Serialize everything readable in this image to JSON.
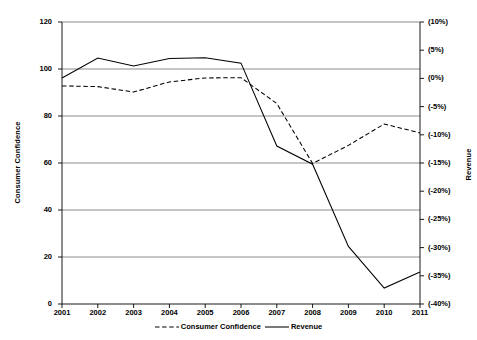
{
  "chart_data": {
    "type": "line",
    "title": "",
    "xlabel": "",
    "grid": true,
    "legend_position": "bottom",
    "categories": [
      "2001",
      "2002",
      "2003",
      "2004",
      "2005",
      "2006",
      "2007",
      "2008",
      "2009",
      "2010",
      "2011"
    ],
    "x": [
      2001,
      2002,
      2003,
      2004,
      2005,
      2006,
      2007,
      2008,
      2009,
      2010,
      2011
    ],
    "axes": {
      "left": {
        "label": "Consumer Confidence",
        "ylim": [
          0,
          120
        ],
        "tick_step": 20,
        "ticks": [
          0,
          20,
          40,
          60,
          80,
          100,
          120
        ],
        "tick_labels": [
          "0",
          "20",
          "40",
          "60",
          "80",
          "100",
          "120"
        ]
      },
      "right": {
        "label": "Revenue",
        "ylim": [
          -40,
          10
        ],
        "tick_step": 5,
        "ticks": [
          10,
          5,
          0,
          -5,
          -10,
          -15,
          -20,
          -25,
          -30,
          -35,
          -40
        ],
        "tick_labels": [
          "(10%)",
          "(5%)",
          "(0%)",
          "(-5%)",
          "(-10%)",
          "(-15%)",
          "(-20%)",
          "(-25%)",
          "(-30%)",
          "(-35%)",
          "(-40%)"
        ]
      }
    },
    "series": [
      {
        "name": "Consumer Confidence",
        "axis": "left",
        "style": "dashed",
        "color": "#000000",
        "values": [
          92.8,
          92.5,
          90.2,
          94.5,
          96.2,
          96.3,
          85.3,
          59.8,
          67.5,
          76.6,
          72.8
        ]
      },
      {
        "name": "Revenue",
        "axis": "right",
        "style": "solid",
        "color": "#000000",
        "values_left_scale": [
          96.2,
          104.7,
          101.3,
          104.5,
          104.8,
          102.5,
          67.2,
          59.5,
          24.5,
          6.8,
          13.6
        ],
        "values": [
          0.1,
          3.6,
          2.2,
          3.5,
          3.6,
          2.6,
          -12.0,
          -15.2,
          -29.8,
          -37.2,
          -34.3
        ]
      }
    ],
    "legend": [
      {
        "name": "Consumer Confidence",
        "style": "dashed"
      },
      {
        "name": "Revenue",
        "style": "solid"
      }
    ]
  }
}
